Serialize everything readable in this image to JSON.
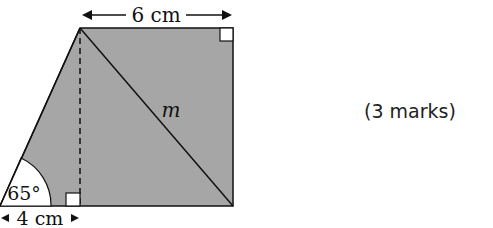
{
  "figure": {
    "top_label": "6 cm",
    "bottom_label": "4 cm",
    "angle_label": "65°",
    "diagonal_label": "m",
    "fill_color": "#a6a6a6",
    "line_color": "#111111"
  },
  "question": {
    "marks": "(3 marks)"
  }
}
